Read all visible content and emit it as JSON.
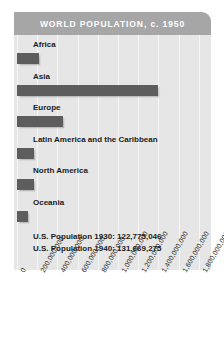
{
  "chart_data": {
    "type": "bar",
    "title": "WORLD POPULATION, c. 1950",
    "orientation": "horizontal",
    "xlabel": "",
    "ylabel": "",
    "xlim": [
      0,
      1800000000
    ],
    "grid": true,
    "legend": "none",
    "categories": [
      "Africa",
      "Asia",
      "Europe",
      "Latin America and the Caribbean",
      "North America",
      "Oceania"
    ],
    "values": [
      220000000,
      1400000000,
      460000000,
      165000000,
      170000000,
      110000000
    ],
    "tick_labels": [
      "0",
      "200,000,000",
      "400,000,000",
      "600,000,000",
      "800,000,000",
      "1,000,000,000",
      "1,200,000,000",
      "1,400,000,000",
      "1,600,000,000",
      "1,800,000,000"
    ],
    "tick_values": [
      0,
      200000000,
      400000000,
      600000000,
      800000000,
      1000000000,
      1200000000,
      1400000000,
      1600000000,
      1800000000
    ],
    "annotations": [
      "U.S. Population 1930: 122,775,046",
      "U.S. Population 1940: 131,669,275"
    ],
    "colors": {
      "bar": "#5d5d5d",
      "header": "#a6a6a6",
      "plot_background": "#e6e6e6",
      "gridline": "#f6f6f6",
      "title_text": "#ffffff",
      "label_text": "#1b1b1b"
    }
  }
}
